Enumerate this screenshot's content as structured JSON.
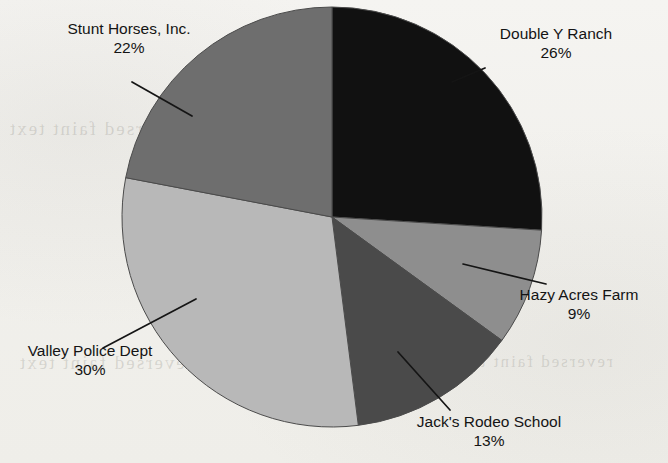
{
  "chart_data": {
    "type": "pie",
    "title": "",
    "categories": [
      "Double Y Ranch",
      "Hazy Acres Farm",
      "Jack's Rodeo School",
      "Valley Police Dept",
      "Stunt Horses, Inc."
    ],
    "values": [
      26,
      9,
      13,
      30,
      22
    ],
    "value_unit": "%",
    "value_labels": [
      "26%",
      "9%",
      "13%",
      "30%",
      "22%"
    ],
    "start_angle_deg": 0,
    "direction": "clockwise",
    "legend": "none",
    "labels_position": "outside-with-leader-lines",
    "grid": false,
    "slice_colors": [
      "#111111",
      "#8e8e8e",
      "#4a4a4a",
      "#b8b8b8",
      "#6e6e6e"
    ],
    "slices": [
      {
        "name": "Double Y Ranch",
        "value": 26,
        "value_label": "26%",
        "color": "#111111",
        "start_deg": 0,
        "end_deg": 93.6
      },
      {
        "name": "Hazy Acres Farm",
        "value": 9,
        "value_label": "9%",
        "color": "#8e8e8e",
        "start_deg": 93.6,
        "end_deg": 126.0
      },
      {
        "name": "Jack's Rodeo School",
        "value": 13,
        "value_label": "13%",
        "color": "#4a4a4a",
        "start_deg": 126.0,
        "end_deg": 172.8
      },
      {
        "name": "Valley Police Dept",
        "value": 30,
        "value_label": "30%",
        "color": "#b8b8b8",
        "start_deg": 172.8,
        "end_deg": 280.8
      },
      {
        "name": "Stunt Horses, Inc.",
        "value": 22,
        "value_label": "22%",
        "color": "#6e6e6e",
        "start_deg": 280.8,
        "end_deg": 360.0
      }
    ]
  },
  "labels": {
    "stunt_horses": {
      "name": "Stunt Horses, Inc.",
      "pct": "22%"
    },
    "double_y": {
      "name": "Double Y Ranch",
      "pct": "26%"
    },
    "hazy_acres": {
      "name": "Hazy Acres Farm",
      "pct": "9%"
    },
    "jacks_rodeo": {
      "name": "Jack's Rodeo School",
      "pct": "13%"
    },
    "valley_police": {
      "name": "Valley Police Dept",
      "pct": "30%"
    }
  },
  "background": {
    "paper_color": "#f3f2ef",
    "ink_color": "#141414",
    "bleed_through_1": "reversed faint text",
    "bleed_through_2": "reversed faint text",
    "bleed_through_3": "reversed faint text"
  }
}
